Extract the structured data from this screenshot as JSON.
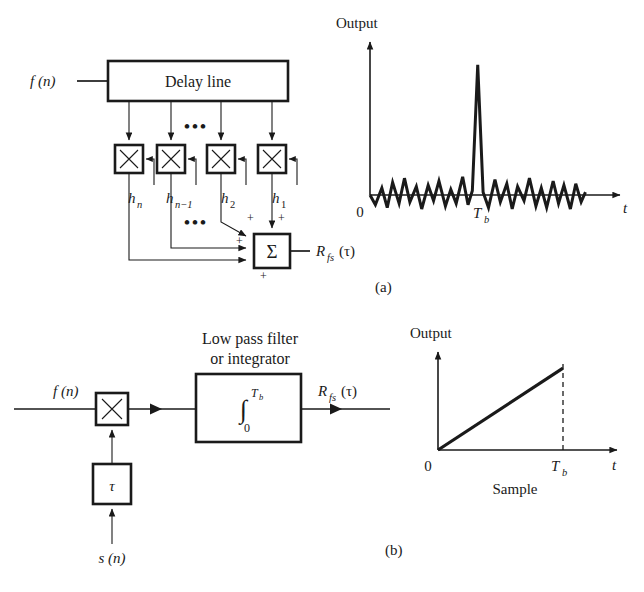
{
  "figure": {
    "caption_a": "(a)",
    "caption_b": "(b)"
  },
  "panel_a": {
    "input_label": "f (n)",
    "delay_line_label": "Delay line",
    "multiplier_symbol": "×",
    "ellipsis": "•••",
    "ellipsis_lower": "•••",
    "taps": [
      {
        "name": "h",
        "sub": "n"
      },
      {
        "name": "h",
        "sub": "n−1"
      },
      {
        "name": "h",
        "sub": "2"
      },
      {
        "name": "h",
        "sub": "1"
      }
    ],
    "summer_symbol": "Σ",
    "plus_signs": [
      "+",
      "+",
      "+",
      "+"
    ],
    "output_label": "R",
    "output_sub": "fs",
    "output_arg": "(τ)"
  },
  "panel_b": {
    "input_label": "f (n)",
    "multiplier_symbol": "×",
    "delay_box_label": "τ",
    "delay_input_label": "s (n)",
    "filter_title_line1": "Low pass filter",
    "filter_title_line2": "or integrator",
    "integral_symbol": "∫",
    "integral_upper": "T",
    "integral_upper_sub": "b",
    "integral_lower": "0",
    "output_label": "R",
    "output_sub": "fs",
    "output_arg": "(τ)"
  },
  "chart_data": [
    {
      "id": "panel-a-output",
      "type": "line",
      "title": "",
      "ylabel": "Output",
      "xlabel": "t",
      "x_origin_label": "0",
      "x_ticks": [
        {
          "label": "T",
          "sub": "b",
          "value": 1.0
        }
      ],
      "grid": false,
      "legend": false,
      "description": "Correlator output: low-level random noise floor with one sharp correlation peak at Tb",
      "xlim": [
        0,
        2.2
      ],
      "ylim": [
        -0.13,
        1.0
      ],
      "series": [
        {
          "name": "correlation output",
          "x": [
            0.0,
            0.05,
            0.11,
            0.16,
            0.21,
            0.27,
            0.32,
            0.37,
            0.43,
            0.48,
            0.54,
            0.59,
            0.64,
            0.7,
            0.75,
            0.8,
            0.86,
            0.91,
            0.95,
            1.0,
            1.05,
            1.1,
            1.16,
            1.21,
            1.27,
            1.32,
            1.37,
            1.43,
            1.48,
            1.54,
            1.59,
            1.64,
            1.7,
            1.75,
            1.8,
            1.86,
            1.91,
            1.96,
            2.0
          ],
          "y": [
            0.0,
            -0.07,
            0.05,
            -0.09,
            0.09,
            -0.06,
            0.12,
            -0.05,
            0.06,
            -0.1,
            0.07,
            -0.04,
            0.1,
            -0.08,
            0.04,
            -0.06,
            0.13,
            -0.07,
            0.03,
            0.93,
            0.02,
            -0.09,
            0.11,
            -0.05,
            0.08,
            -0.1,
            0.06,
            -0.04,
            0.12,
            -0.08,
            0.05,
            -0.09,
            0.1,
            -0.06,
            0.07,
            -0.1,
            0.08,
            -0.05,
            0.02
          ]
        }
      ]
    },
    {
      "id": "panel-b-output",
      "type": "line",
      "title": "",
      "ylabel": "Output",
      "xlabel": "t",
      "x_origin_label": "0",
      "sublabel": "Sample",
      "x_ticks": [
        {
          "label": "T",
          "sub": "b",
          "value": 1.0
        }
      ],
      "grid": false,
      "legend": false,
      "description": "Integrator output: linear ramp rising from origin to peak at Tb, dashed drop line at Tb",
      "xlim": [
        0,
        1.45
      ],
      "ylim": [
        0,
        1.0
      ],
      "series": [
        {
          "name": "integrator ramp",
          "x": [
            0.0,
            1.0
          ],
          "y": [
            0.0,
            0.92
          ]
        }
      ]
    }
  ]
}
